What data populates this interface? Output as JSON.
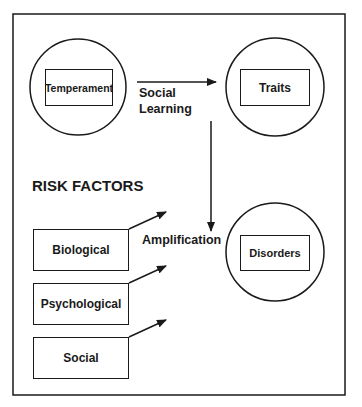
{
  "diagram": {
    "nodes": {
      "temperament": "Temperament",
      "traits": "Traits",
      "disorders": "Disorders"
    },
    "edges": {
      "social_learning_line1": "Social",
      "social_learning_line2": "Learning",
      "amplification": "Amplification"
    },
    "risk_factors": {
      "heading": "RISK FACTORS",
      "items": [
        "Biological",
        "Psychological",
        "Social"
      ]
    },
    "colors": {
      "line": "#1a1a1a",
      "background": "#ffffff"
    }
  }
}
